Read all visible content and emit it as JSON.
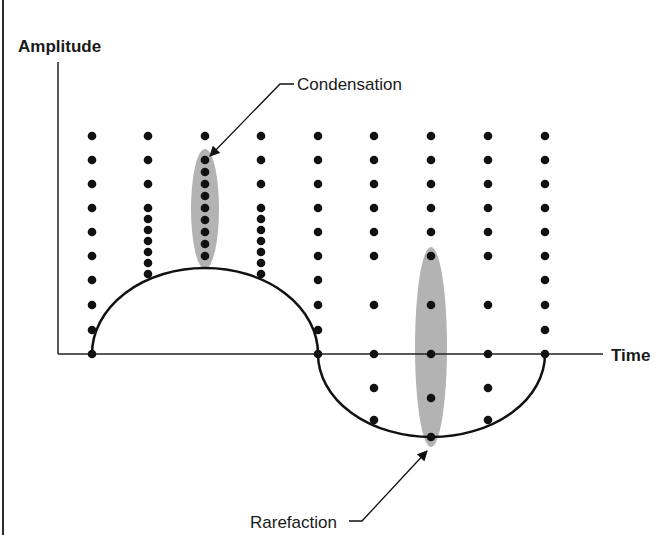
{
  "diagram": {
    "title": "",
    "y_axis_label": "Amplitude",
    "x_axis_label": "Time",
    "annotations": {
      "condensation": "Condensation",
      "rarefaction": "Rarefaction"
    },
    "colors": {
      "ink": "#111111",
      "highlight": "#b3b3b3",
      "background": "#ffffff"
    },
    "columns": [
      {
        "x": 92,
        "dots_y": [
          136,
          160,
          184,
          208,
          232,
          256,
          280,
          305,
          330,
          354
        ]
      },
      {
        "x": 148,
        "dots_y": [
          136,
          160,
          184,
          208,
          219,
          230,
          241,
          252,
          263,
          274
        ]
      },
      {
        "x": 205,
        "dots_y": [
          136,
          160,
          172,
          184,
          196,
          208,
          220,
          232,
          244,
          256
        ]
      },
      {
        "x": 261,
        "dots_y": [
          136,
          160,
          184,
          208,
          219,
          230,
          241,
          252,
          263,
          274
        ]
      },
      {
        "x": 318,
        "dots_y": [
          136,
          160,
          184,
          208,
          232,
          256,
          280,
          305,
          330,
          354
        ]
      },
      {
        "x": 374,
        "dots_y": [
          136,
          160,
          184,
          208,
          232,
          256,
          305,
          354,
          388,
          420
        ]
      },
      {
        "x": 431,
        "dots_y": [
          136,
          160,
          184,
          208,
          232,
          256,
          305,
          354,
          398,
          437
        ]
      },
      {
        "x": 488,
        "dots_y": [
          136,
          160,
          184,
          208,
          232,
          256,
          305,
          354,
          388,
          420
        ]
      },
      {
        "x": 545,
        "dots_y": [
          136,
          160,
          184,
          208,
          232,
          256,
          280,
          305,
          330,
          354
        ]
      }
    ],
    "wave": {
      "crest_start_x": 92,
      "crest_end_x": 318,
      "crest_peak_y": 268,
      "trough_start_x": 318,
      "trough_end_x": 545,
      "trough_min_y": 437,
      "axis_y": 354
    },
    "highlights": [
      {
        "name": "condensation-region",
        "cx": 205,
        "cy": 209,
        "rx": 14,
        "ry": 60
      },
      {
        "name": "rarefaction-region",
        "cx": 431,
        "cy": 347,
        "rx": 16,
        "ry": 100
      }
    ]
  }
}
